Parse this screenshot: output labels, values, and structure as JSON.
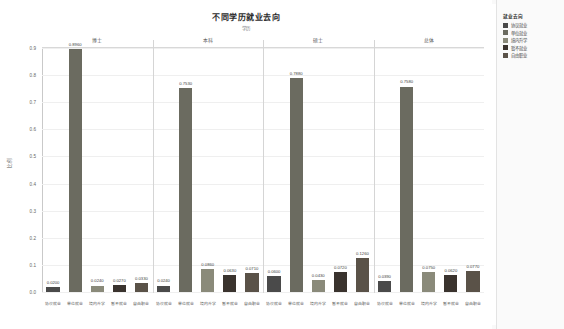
{
  "chart": {
    "title": "不同学历就业去向",
    "subtitle": "学历",
    "ylabel": "比例"
  },
  "legend": {
    "title": "就业去向",
    "items": [
      {
        "label": "协议就业",
        "color": "#4a4a4a"
      },
      {
        "label": "单位就业",
        "color": "#6b6b60"
      },
      {
        "label": "境内升学",
        "color": "#8a8a7a"
      },
      {
        "label": "暂不就业",
        "color": "#3a332e"
      },
      {
        "label": "自由职业",
        "color": "#5a5248"
      }
    ]
  },
  "chart_data": {
    "type": "bar",
    "title": "不同学历就业去向",
    "xlabel": "学历",
    "ylabel": "比例",
    "ylim": [
      0.0,
      0.9
    ],
    "yticks": [
      "0.0",
      "0.1",
      "0.2",
      "0.3",
      "0.4",
      "0.5",
      "0.6",
      "0.7",
      "0.8",
      "0.9"
    ],
    "grid": true,
    "legend_position": "right",
    "groups": [
      {
        "name": "博士",
        "categories": [
          "协议就业",
          "单位就业",
          "境内升学",
          "暂不就业",
          "自由职业"
        ],
        "values": [
          0.02,
          0.896,
          0.024,
          0.027,
          0.033
        ]
      },
      {
        "name": "本科",
        "categories": [
          "协议就业",
          "单位就业",
          "境内升学",
          "暂不就业",
          "自由职业"
        ],
        "values": [
          0.024,
          0.753,
          0.086,
          0.063,
          0.071
        ]
      },
      {
        "name": "硕士",
        "categories": [
          "协议就业",
          "单位就业",
          "境内升学",
          "暂不就业",
          "自由职业"
        ],
        "values": [
          0.06,
          0.788,
          0.043,
          0.072,
          0.126
        ]
      },
      {
        "name": "总体",
        "categories": [
          "协议就业",
          "单位就业",
          "境内升学",
          "暂不就业",
          "自由职业"
        ],
        "values": [
          0.039,
          0.758,
          0.075,
          0.062,
          0.077
        ]
      }
    ]
  }
}
